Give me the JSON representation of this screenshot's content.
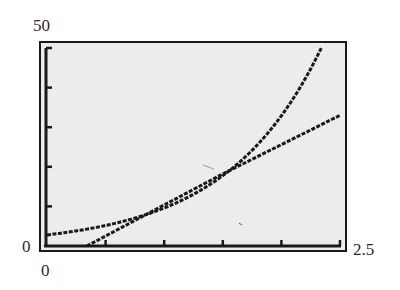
{
  "window": {
    "xmin_label": "0",
    "xmax_label": "2.5",
    "ymin_label": "0",
    "ymax_label": "50"
  },
  "colors": {
    "screen_bg": "#ececec",
    "frame": "#1a1a1a",
    "curve": "#1a1a1a"
  },
  "chart_data": {
    "type": "line",
    "title": "",
    "xlabel": "",
    "ylabel": "",
    "xlim": [
      0,
      2.5
    ],
    "ylim": [
      0,
      50
    ],
    "x_tick_step": 0.5,
    "y_tick_step": 10,
    "grid": false,
    "legend": null,
    "annotations": [
      "0",
      "50",
      "0",
      "2.5"
    ],
    "series": [
      {
        "name": "exponential curve",
        "x": [
          0,
          0.25,
          0.5,
          0.75,
          0.88,
          1.0,
          1.25,
          1.5,
          1.75,
          2.0,
          2.25,
          2.34
        ],
        "values": [
          2.8,
          3.8,
          5.1,
          7.0,
          8.3,
          9.6,
          13.1,
          18.2,
          24.3,
          33.0,
          44.5,
          50.0
        ]
      },
      {
        "name": "linear",
        "x": [
          0.34,
          0.88,
          1.5,
          2.0,
          2.5
        ],
        "values": [
          0,
          8.5,
          18.2,
          25.6,
          33.0
        ]
      }
    ],
    "intersections": [
      {
        "x": 0.88,
        "y": 9.0
      },
      {
        "x": 1.5,
        "y": 18.2
      }
    ]
  }
}
